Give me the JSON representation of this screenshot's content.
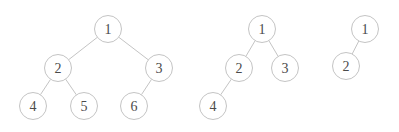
{
  "diagram": {
    "node_radius": 13.5,
    "colors": {
      "stroke": "#c4c4c4",
      "text": "#4a4a4a",
      "background": "#ffffff"
    },
    "trees": [
      {
        "name": "tree-complete-6",
        "nodes": [
          {
            "id": "1",
            "label": "1",
            "x": 108,
            "y": 29
          },
          {
            "id": "2",
            "label": "2",
            "x": 58,
            "y": 68
          },
          {
            "id": "3",
            "label": "3",
            "x": 159,
            "y": 68
          },
          {
            "id": "4",
            "label": "4",
            "x": 33,
            "y": 106
          },
          {
            "id": "5",
            "label": "5",
            "x": 84,
            "y": 106
          },
          {
            "id": "6",
            "label": "6",
            "x": 134,
            "y": 106
          }
        ],
        "edges": [
          [
            "1",
            "2"
          ],
          [
            "1",
            "3"
          ],
          [
            "2",
            "4"
          ],
          [
            "2",
            "5"
          ],
          [
            "3",
            "6"
          ]
        ]
      },
      {
        "name": "tree-complete-4",
        "nodes": [
          {
            "id": "1",
            "label": "1",
            "x": 262,
            "y": 29
          },
          {
            "id": "2",
            "label": "2",
            "x": 239,
            "y": 68
          },
          {
            "id": "3",
            "label": "3",
            "x": 285,
            "y": 68
          },
          {
            "id": "4",
            "label": "4",
            "x": 213,
            "y": 106
          }
        ],
        "edges": [
          [
            "1",
            "2"
          ],
          [
            "1",
            "3"
          ],
          [
            "2",
            "4"
          ]
        ]
      },
      {
        "name": "tree-complete-2",
        "nodes": [
          {
            "id": "1",
            "label": "1",
            "x": 365,
            "y": 29
          },
          {
            "id": "2",
            "label": "2",
            "x": 346,
            "y": 66
          }
        ],
        "edges": [
          [
            "1",
            "2"
          ]
        ]
      }
    ]
  }
}
